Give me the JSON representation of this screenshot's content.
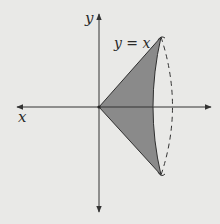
{
  "figure": {
    "axes": {
      "x_label": "x",
      "y_label": "y"
    },
    "curve_label": "y = x",
    "colors": {
      "background": "#e9e9e7",
      "axis": "#333333",
      "fill": "#8a8a8a",
      "outline": "#2f2f2f"
    }
  }
}
